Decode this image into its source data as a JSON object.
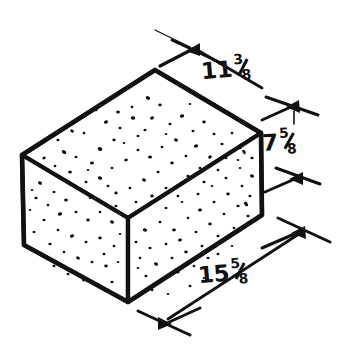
{
  "figure": {
    "style": "hand-drawn line art",
    "background_color": "#ffffff",
    "ink_color": "#111111"
  },
  "dimensions": [
    {
      "id": "width-top-left",
      "name": "11 3/8",
      "whole": "11",
      "numerator": "3",
      "denominator": "8",
      "position": "upper-right",
      "edge": "top-rear-left edge"
    },
    {
      "id": "height-right",
      "name": "7 5/8",
      "whole": "7",
      "numerator": "5",
      "denominator": "8",
      "position": "right",
      "edge": "vertical right edge"
    },
    {
      "id": "length-bottom",
      "name": "15 5/8",
      "whole": "15",
      "numerator": "5",
      "denominator": "8",
      "position": "lower-right",
      "edge": "bottom-front-right edge"
    }
  ],
  "markers": {
    "type": "slash-tick-arrow",
    "count": 6
  }
}
